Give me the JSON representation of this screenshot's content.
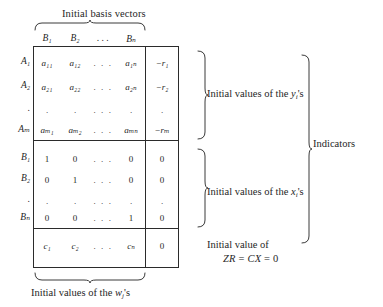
{
  "figure": {
    "type": "simplex-tableau",
    "top_caption": "Initial basis vectors",
    "bottom_caption_prefix": "Initial values of the ",
    "bottom_caption_symbol": "w",
    "bottom_caption_subscript": "j",
    "bottom_caption_suffix": "'s"
  },
  "columns": {
    "headers": [
      "B₁",
      "B₂",
      ". . .",
      "Bₙ"
    ],
    "rhs_header": ""
  },
  "rows": [
    {
      "label": "A₁",
      "cells": [
        "a₁₁",
        "a₁₂",
        ". . .",
        "a₁ₙ"
      ],
      "rhs": "−r₁",
      "kind": "a-row"
    },
    {
      "label": "A₂",
      "cells": [
        "a₂₁",
        "a₂₂",
        ". . .",
        "a₂ₙ"
      ],
      "rhs": "−r₂",
      "kind": "a-row"
    },
    {
      "label": ".",
      "cells": [
        ".",
        ".",
        ". . .",
        "."
      ],
      "rhs": ".",
      "kind": "ellipsis-row"
    },
    {
      "label": "Aₘ",
      "cells": [
        "aₘ₁",
        "aₘ₂",
        ". . .",
        "aₘₙ"
      ],
      "rhs": "−rₘ",
      "kind": "a-row"
    },
    {
      "label": "B₁",
      "cells": [
        "1",
        "0",
        ". . .",
        "0"
      ],
      "rhs": "0",
      "kind": "b-row"
    },
    {
      "label": "B₂",
      "cells": [
        "0",
        "1",
        ". . .",
        "0"
      ],
      "rhs": "0",
      "kind": "b-row"
    },
    {
      "label": ".",
      "cells": [
        ".",
        ".",
        ". . .",
        "."
      ],
      "rhs": ".",
      "kind": "ellipsis-row"
    },
    {
      "label": "Bₙ",
      "cells": [
        "0",
        "0",
        ". . .",
        "1"
      ],
      "rhs": "0",
      "kind": "b-row"
    },
    {
      "label": "",
      "cells": [
        "c₁",
        "c₂",
        ". . .",
        "cₙ"
      ],
      "rhs": "0",
      "kind": "c-row"
    }
  ],
  "annotations": {
    "y_values_prefix": "Initial values of the ",
    "y_values_symbol": "y",
    "y_values_subscript": "i",
    "y_values_suffix": "'s",
    "x_values_prefix": "Initial values of the ",
    "x_values_symbol": "x",
    "x_values_subscript": "i",
    "x_values_suffix": "'s",
    "zr_line1": "Initial value of",
    "zr_line2_left": "ZR",
    "zr_line2_eq1": " = ",
    "zr_line2_mid": "CX",
    "zr_line2_eq2": " = ",
    "zr_line2_right": "0",
    "indicators": "Indicators"
  },
  "colors": {
    "background": "#ffffff",
    "ink": "#1f1f1f",
    "rule": "#2b2b2b",
    "brace": "#3a3a3a"
  }
}
